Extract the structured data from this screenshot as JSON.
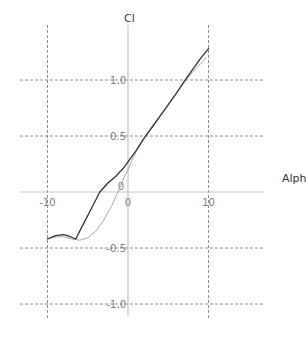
{
  "chart_data": {
    "type": "line",
    "title": "",
    "xlabel": "Alpha",
    "ylabel": "Cl",
    "xlim": [
      -14,
      17
    ],
    "ylim": [
      -1.1,
      1.5
    ],
    "grid": true,
    "legend": null,
    "x_ticks": [
      -10,
      0,
      10
    ],
    "x_tick_labels": [
      "-10",
      "0",
      "10"
    ],
    "y_ticks": [
      -1.0,
      -0.5,
      0.5,
      1.0
    ],
    "y_tick_labels": [
      "-1.0",
      "-0.5",
      "0.5",
      "1.0"
    ],
    "origin_label": "0",
    "series": [
      {
        "name": "dark-curve",
        "color": "#333333",
        "width": 1.3,
        "x": [
          -10,
          -9,
          -8,
          -7.5,
          -6.5,
          -5.5,
          -4.5,
          -3.5,
          -2.5,
          -1.5,
          -0.5,
          0,
          1,
          2,
          3,
          4,
          5,
          6,
          7,
          8,
          9,
          10
        ],
        "y": [
          -0.42,
          -0.39,
          -0.38,
          -0.39,
          -0.42,
          -0.28,
          -0.14,
          0.0,
          0.08,
          0.14,
          0.22,
          0.27,
          0.37,
          0.48,
          0.58,
          0.68,
          0.78,
          0.88,
          0.99,
          1.09,
          1.19,
          1.28
        ]
      },
      {
        "name": "light-curve",
        "color": "#a8a8a8",
        "width": 1.0,
        "x": [
          -10,
          -9,
          -8,
          -7,
          -6,
          -5,
          -4,
          -3,
          -2,
          -1.5,
          -1,
          -0.5,
          0,
          0.5,
          1,
          2,
          3,
          4,
          5,
          6,
          7,
          8,
          9,
          9.7
        ],
        "y": [
          -0.42,
          -0.4,
          -0.4,
          -0.42,
          -0.43,
          -0.41,
          -0.35,
          -0.25,
          -0.12,
          -0.04,
          0.04,
          0.13,
          0.2,
          0.28,
          0.36,
          0.48,
          0.58,
          0.68,
          0.78,
          0.88,
          0.98,
          1.07,
          1.14,
          1.2
        ]
      }
    ]
  }
}
